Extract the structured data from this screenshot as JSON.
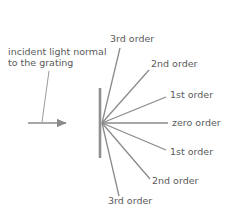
{
  "diagram": {
    "colors": {
      "ray": "#8a8a8a",
      "grating": "#8f8f8f",
      "text": "#5a5a5a",
      "background": "#ffffff"
    },
    "incident": {
      "label_line1": "incident light normal",
      "label_line2": "to the grating",
      "label_full": "incident light normal\nto the grating",
      "arrow_start_x": 28,
      "arrow_start_y": 123,
      "arrow_end_x": 68,
      "arrow_end_y": 123
    },
    "grating": {
      "name": "grating",
      "x": 100,
      "top_y": 88,
      "bottom_y": 158
    },
    "vertex": {
      "x": 102,
      "y": 123
    },
    "orders": [
      {
        "id": "order-3-up",
        "label": "3rd order",
        "side": "up",
        "order": 3,
        "end_x": 120,
        "end_y": 48,
        "label_x": 110,
        "label_y": 33
      },
      {
        "id": "order-2-up",
        "label": "2nd order",
        "side": "up",
        "order": 2,
        "end_x": 149,
        "end_y": 70,
        "label_x": 151,
        "label_y": 58
      },
      {
        "id": "order-1-up",
        "label": "1st order",
        "side": "up",
        "order": 1,
        "end_x": 166,
        "end_y": 97,
        "label_x": 170,
        "label_y": 89
      },
      {
        "id": "order-0",
        "label": "zero order",
        "side": "center",
        "order": 0,
        "end_x": 168,
        "end_y": 123,
        "label_x": 172,
        "label_y": 117
      },
      {
        "id": "order-1-down",
        "label": "1st order",
        "side": "down",
        "order": 1,
        "end_x": 166,
        "end_y": 150,
        "label_x": 170,
        "label_y": 146
      },
      {
        "id": "order-2-down",
        "label": "2nd order",
        "side": "down",
        "order": 2,
        "end_x": 150,
        "end_y": 179,
        "label_x": 152,
        "label_y": 175
      },
      {
        "id": "order-3-down",
        "label": "3rd order",
        "side": "down",
        "order": 3,
        "end_x": 119,
        "end_y": 196,
        "label_x": 108,
        "label_y": 195
      }
    ]
  }
}
